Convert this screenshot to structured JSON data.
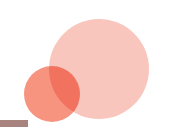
{
  "graphic": {
    "title": "Two-circle proportional Venn diagram",
    "background_color": "#ffffff",
    "width": 172,
    "height": 137
  },
  "chart_data": {
    "type": "venn",
    "title": "",
    "subtitle": "",
    "xlabel": "",
    "ylabel": "",
    "grid": false,
    "legend_position": "none",
    "blend_mode": "multiply",
    "sets": [
      {
        "name": "large-set",
        "label": "",
        "color": "#f9c6bd",
        "center_x": 99,
        "center_y": 69,
        "radius": 50,
        "relative_size": 1.0
      },
      {
        "name": "small-set",
        "label": "",
        "color": "#f79480",
        "center_x": 52,
        "center_y": 94,
        "radius": 28,
        "relative_size": 0.31
      }
    ],
    "intersection": {
      "name": "overlap-region",
      "label": "",
      "color": "#f18a74",
      "present": true
    },
    "annotations": [
      {
        "name": "baseline-bar",
        "label": "",
        "color": "#a9837e",
        "x": 0,
        "y": 120,
        "width": 28,
        "height": 7
      }
    ]
  }
}
